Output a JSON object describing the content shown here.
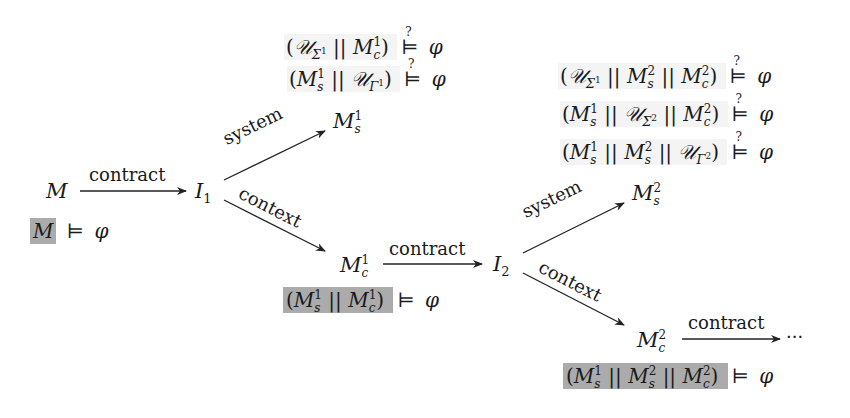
{
  "diagram": {
    "type": "contract-based decomposition flow",
    "colors": {
      "text": "#1a1a1a",
      "highlight_box": "#ababab",
      "light_box": "#f4f4f4",
      "arrow": "#222222"
    },
    "nodes": {
      "M": {
        "base": "M"
      },
      "I1": {
        "base": "I",
        "sub": "1"
      },
      "Ms1": {
        "base": "M",
        "sup": "1",
        "sub": "s"
      },
      "Mc1": {
        "base": "M",
        "sup": "1",
        "sub": "c"
      },
      "I2": {
        "base": "I",
        "sub": "2"
      },
      "Ms2": {
        "base": "M",
        "sup": "2",
        "sub": "s"
      },
      "Mc2": {
        "base": "M",
        "sup": "2",
        "sub": "c"
      },
      "ellipsis": {
        "text": "···"
      }
    },
    "edges": [
      {
        "from": "M",
        "to": "I1",
        "label": "contract"
      },
      {
        "from": "I1",
        "to": "Ms1",
        "label": "system"
      },
      {
        "from": "I1",
        "to": "Mc1",
        "label": "context"
      },
      {
        "from": "Mc1",
        "to": "I2",
        "label": "contract"
      },
      {
        "from": "I2",
        "to": "Ms2",
        "label": "system"
      },
      {
        "from": "I2",
        "to": "Mc2",
        "label": "context"
      },
      {
        "from": "Mc2",
        "to": "ellipsis",
        "label": "contract"
      }
    ],
    "formulas": {
      "models": "⊨",
      "models_q": "⊨",
      "q": "?",
      "phi": "φ",
      "par": "||",
      "lp": "(",
      "rp": ")",
      "U": "𝒰",
      "Sigma": "Σ",
      "Gamma": "Γ",
      "f0": "M ⊨ φ",
      "f1a": "(𝒰_{Σ¹} || M_c^1) ⊨? φ",
      "f1b": "(M_s^1 || 𝒰_{Γ¹}) ⊨? φ",
      "f1c": "(M_s^1 || M_c^1) ⊨ φ",
      "f2a": "(𝒰_{Σ¹} || M_s^2 || M_c^2) ⊨? φ",
      "f2b": "(M_s^1 || 𝒰_{Σ²} || M_c^2) ⊨? φ",
      "f2c": "(M_s^1 || M_s^2 || 𝒰_{Γ²}) ⊨? φ",
      "f2d": "(M_s^1 || M_s^2 || M_c^2) ⊨ φ"
    },
    "sup": {
      "one": "1",
      "two": "2"
    },
    "sub": {
      "s": "s",
      "c": "c"
    }
  }
}
